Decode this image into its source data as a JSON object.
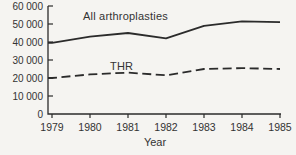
{
  "figure": {
    "background": "#f5f4f1",
    "line_color": "#2b2b2b",
    "text_color": "#333333"
  },
  "chart_data": {
    "type": "line",
    "title": "",
    "xlabel": "Year",
    "ylabel": "",
    "x": [
      1979,
      1980,
      1981,
      1982,
      1983,
      1984,
      1985
    ],
    "x_tick_labels": [
      "1979",
      "1980",
      "1981",
      "1982",
      "1983",
      "1984",
      "1985"
    ],
    "ylim": [
      0,
      60000
    ],
    "ytick_interval": 10000,
    "y_tick_labels": [
      "0",
      "10 000",
      "20 000",
      "30 000",
      "40 000",
      "50 000",
      "60 000"
    ],
    "grid": false,
    "legend_position": "inline-annotations",
    "series": [
      {
        "name": "All arthroplasties",
        "style": "solid",
        "values": [
          39500,
          43000,
          45000,
          42000,
          49000,
          51500,
          51000
        ]
      },
      {
        "name": "THR",
        "style": "dashed",
        "values": [
          20000,
          22000,
          23000,
          21500,
          25000,
          25500,
          25000
        ]
      }
    ]
  }
}
